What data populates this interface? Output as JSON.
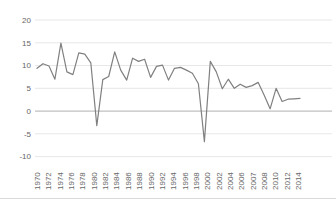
{
  "chart_data": {
    "type": "line",
    "title": "",
    "xlabel": "",
    "ylabel": "",
    "x": [
      1970,
      1971,
      1972,
      1973,
      1974,
      1975,
      1976,
      1977,
      1978,
      1979,
      1980,
      1981,
      1982,
      1983,
      1984,
      1985,
      1986,
      1987,
      1988,
      1989,
      1990,
      1991,
      1992,
      1993,
      1994,
      1995,
      1996,
      1997,
      1998,
      1999,
      2000,
      2001,
      2002,
      2003,
      2004,
      2005,
      2006,
      2007,
      2008,
      2009,
      2010,
      2011,
      2012,
      2013,
      2014
    ],
    "series": [
      {
        "name": "value",
        "values": [
          9.4,
          10.4,
          9.9,
          7.0,
          14.9,
          8.6,
          8.0,
          12.8,
          12.5,
          10.6,
          -3.2,
          6.9,
          7.6,
          13.0,
          9.0,
          6.8,
          11.6,
          10.9,
          11.4,
          7.4,
          9.8,
          10.1,
          6.8,
          9.4,
          9.6,
          9.0,
          8.3,
          6.0,
          -6.7,
          10.9,
          8.6,
          4.9,
          7.0,
          5.0,
          5.9,
          5.2,
          5.6,
          6.3,
          3.5,
          0.5,
          5.0,
          2.1,
          2.6,
          2.7,
          2.8
        ]
      }
    ],
    "x_tick_labels": [
      "1970",
      "1972",
      "1974",
      "1976",
      "1978",
      "1980",
      "1982",
      "1984",
      "1986",
      "1988",
      "1990",
      "1992",
      "1994",
      "1996",
      "1998",
      "2000",
      "2002",
      "2004",
      "2006",
      "2007",
      "2008",
      "2010",
      "2012",
      "2014"
    ],
    "y_ticks": [
      20,
      15,
      10,
      5,
      0,
      -5,
      -10
    ],
    "ylim": [
      -10,
      20
    ],
    "grid": "horizontal",
    "legend": "none",
    "line_color": "#808080",
    "grid_color": "#e7e7e7",
    "zero_line_color": "#b0b0b0",
    "tick_text_color": "#666666",
    "divider_color": "#d9d9d9"
  }
}
